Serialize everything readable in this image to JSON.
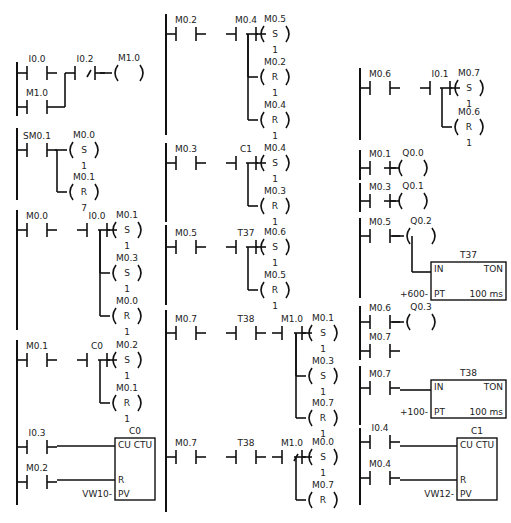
{
  "colors": {
    "line": "#111111",
    "background": "#ffffff",
    "text": "#222222"
  },
  "networks": [
    {
      "id": "n1",
      "column": 1,
      "rail_x": 17,
      "rail_y": [
        62,
        116
      ],
      "elements": [
        {
          "type": "contact",
          "label": "I0.0",
          "x": 17,
          "y": 73,
          "len": 40
        },
        {
          "type": "contact",
          "label": "M1.0",
          "x": 17,
          "y": 107,
          "len": 40,
          "branch_to_x": 65,
          "join_y": 73
        },
        {
          "type": "contact_nc",
          "label": "I0.2",
          "x": 65,
          "y": 73,
          "len": 30
        },
        {
          "type": "coil",
          "label": "M1.0",
          "op": "",
          "num": "",
          "x": 112,
          "y": 73
        }
      ]
    },
    {
      "id": "n2",
      "column": 1,
      "rail_x": 17,
      "rail_y": [
        128,
        200
      ],
      "elements": [
        {
          "type": "contact",
          "label": "SM0.1",
          "x": 17,
          "y": 150,
          "len": 40
        },
        {
          "type": "coil",
          "label": "M0.0",
          "op": "S",
          "num": "1",
          "x": 67,
          "y": 150
        },
        {
          "type": "coil",
          "label": "M0.1",
          "op": "R",
          "num": "7",
          "x": 67,
          "y": 192,
          "branch": true
        }
      ]
    },
    {
      "id": "n3",
      "column": 1,
      "rail_x": 17,
      "rail_y": [
        210,
        330
      ],
      "elements": [
        {
          "type": "contact",
          "label": "M0.0",
          "x": 17,
          "y": 230,
          "len": 40
        },
        {
          "type": "contact",
          "label": "I0.0",
          "x": 77,
          "y": 230,
          "len": 40
        },
        {
          "type": "coil",
          "label": "M0.1",
          "op": "S",
          "num": "1",
          "x": 110,
          "y": 230
        },
        {
          "type": "coil",
          "label": "M0.3",
          "op": "S",
          "num": "1",
          "x": 110,
          "y": 273,
          "branch": true
        },
        {
          "type": "coil",
          "label": "M0.0",
          "op": "R",
          "num": "1",
          "x": 110,
          "y": 316,
          "branch": true
        }
      ]
    },
    {
      "id": "n4",
      "column": 1,
      "rail_x": 17,
      "rail_y": [
        340,
        430
      ],
      "elements": [
        {
          "type": "contact",
          "label": "M0.1",
          "x": 17,
          "y": 360,
          "len": 40
        },
        {
          "type": "contact",
          "label": "C0",
          "x": 77,
          "y": 360,
          "len": 40
        },
        {
          "type": "coil",
          "label": "M0.2",
          "op": "S",
          "num": "1",
          "x": 110,
          "y": 360
        },
        {
          "type": "coil",
          "label": "M0.1",
          "op": "R",
          "num": "1",
          "x": 110,
          "y": 403,
          "branch": true
        }
      ]
    },
    {
      "id": "n5",
      "column": 1,
      "rail_x": 17,
      "rail_y": [
        430,
        505
      ],
      "elements": [
        {
          "type": "contact",
          "label": "I0.3",
          "x": 17,
          "y": 447,
          "len": 40
        },
        {
          "type": "contact",
          "label": "M0.2",
          "x": 17,
          "y": 482,
          "len": 40
        },
        {
          "type": "counter",
          "label": "C0",
          "box_type": "CTU",
          "x": 115,
          "y": 438,
          "w": 40,
          "h": 62,
          "pins": [
            "CU",
            "R",
            "PV"
          ],
          "pv": "VW10"
        }
      ]
    },
    {
      "id": "n6",
      "column": 2,
      "rail_x": 166,
      "rail_y": [
        14,
        135
      ],
      "elements": [
        {
          "type": "contact",
          "label": "M0.2",
          "x": 166,
          "y": 34,
          "len": 40
        },
        {
          "type": "contact",
          "label": "M0.4",
          "x": 226,
          "y": 34,
          "len": 40
        },
        {
          "type": "coil",
          "label": "M0.5",
          "op": "S",
          "num": "1",
          "x": 258,
          "y": 34
        },
        {
          "type": "coil",
          "label": "M0.2",
          "op": "R",
          "num": "1",
          "x": 258,
          "y": 77,
          "branch": true
        },
        {
          "type": "coil",
          "label": "M0.4",
          "op": "R",
          "num": "1",
          "x": 258,
          "y": 120,
          "branch": true
        }
      ]
    },
    {
      "id": "n7",
      "column": 2,
      "rail_x": 166,
      "rail_y": [
        143,
        222
      ],
      "elements": [
        {
          "type": "contact",
          "label": "M0.3",
          "x": 166,
          "y": 163,
          "len": 40
        },
        {
          "type": "contact",
          "label": "C1",
          "x": 226,
          "y": 163,
          "len": 40
        },
        {
          "type": "coil",
          "label": "M0.4",
          "op": "S",
          "num": "1",
          "x": 258,
          "y": 163
        },
        {
          "type": "coil",
          "label": "M0.3",
          "op": "R",
          "num": "1",
          "x": 258,
          "y": 206,
          "branch": true
        }
      ]
    },
    {
      "id": "n8",
      "column": 2,
      "rail_x": 166,
      "rail_y": [
        225,
        305
      ],
      "elements": [
        {
          "type": "contact",
          "label": "M0.5",
          "x": 166,
          "y": 247,
          "len": 40
        },
        {
          "type": "contact",
          "label": "T37",
          "x": 226,
          "y": 247,
          "len": 40
        },
        {
          "type": "coil",
          "label": "M0.6",
          "op": "S",
          "num": "1",
          "x": 258,
          "y": 247
        },
        {
          "type": "coil",
          "label": "M0.5",
          "op": "R",
          "num": "1",
          "x": 258,
          "y": 290,
          "branch": true
        }
      ]
    },
    {
      "id": "n9",
      "column": 2,
      "rail_x": 166,
      "rail_y": [
        310,
        430
      ],
      "elements": [
        {
          "type": "contact",
          "label": "M0.7",
          "x": 166,
          "y": 333,
          "len": 40
        },
        {
          "type": "contact",
          "label": "T38",
          "x": 226,
          "y": 333,
          "len": 40
        },
        {
          "type": "contact",
          "label": "M1.0",
          "x": 272,
          "y": 333,
          "len": 40
        },
        {
          "type": "coil",
          "label": "M0.1",
          "op": "S",
          "num": "1",
          "x": 306,
          "y": 333
        },
        {
          "type": "coil",
          "label": "M0.3",
          "op": "S",
          "num": "1",
          "x": 306,
          "y": 376,
          "branch": true
        },
        {
          "type": "coil",
          "label": "M0.7",
          "op": "R",
          "num": "1",
          "x": 306,
          "y": 418,
          "branch": true
        }
      ]
    },
    {
      "id": "n10",
      "column": 2,
      "rail_x": 166,
      "rail_y": [
        430,
        512
      ],
      "elements": [
        {
          "type": "contact",
          "label": "M0.7",
          "x": 166,
          "y": 457,
          "len": 40
        },
        {
          "type": "contact",
          "label": "T38",
          "x": 226,
          "y": 457,
          "len": 40
        },
        {
          "type": "contact_nc",
          "label": "M1.0",
          "x": 272,
          "y": 457,
          "len": 40
        },
        {
          "type": "coil",
          "label": "M0.0",
          "op": "S",
          "num": "1",
          "x": 306,
          "y": 457
        },
        {
          "type": "coil",
          "label": "M0.7",
          "op": "R",
          "num": "",
          "x": 306,
          "y": 500,
          "branch": true
        }
      ]
    },
    {
      "id": "n11",
      "column": 3,
      "rail_x": 360,
      "rail_y": [
        68,
        140
      ],
      "elements": [
        {
          "type": "contact",
          "label": "M0.6",
          "x": 360,
          "y": 88,
          "len": 40
        },
        {
          "type": "contact",
          "label": "I0.1",
          "x": 420,
          "y": 88,
          "len": 40
        },
        {
          "type": "coil",
          "label": "M0.7",
          "op": "S",
          "num": "1",
          "x": 452,
          "y": 88
        },
        {
          "type": "coil",
          "label": "M0.6",
          "op": "R",
          "num": "1",
          "x": 452,
          "y": 127,
          "branch": true
        }
      ]
    },
    {
      "id": "n12",
      "column": 3,
      "rail_x": 360,
      "rail_y": [
        150,
        180
      ],
      "elements": [
        {
          "type": "contact",
          "label": "M0.1",
          "x": 360,
          "y": 168,
          "len": 40
        },
        {
          "type": "coil",
          "label": "Q0.0",
          "op": "",
          "num": "",
          "x": 396,
          "y": 168
        }
      ]
    },
    {
      "id": "n13",
      "column": 3,
      "rail_x": 360,
      "rail_y": [
        183,
        212
      ],
      "elements": [
        {
          "type": "contact",
          "label": "M0.3",
          "x": 360,
          "y": 201,
          "len": 40
        },
        {
          "type": "coil",
          "label": "Q0.1",
          "op": "",
          "num": "",
          "x": 396,
          "y": 201
        }
      ]
    },
    {
      "id": "n14",
      "column": 3,
      "rail_x": 360,
      "rail_y": [
        218,
        298
      ],
      "elements": [
        {
          "type": "contact",
          "label": "M0.5",
          "x": 360,
          "y": 236,
          "len": 40
        },
        {
          "type": "coil",
          "label": "Q0.2",
          "op": "",
          "num": "",
          "x": 404,
          "y": 236
        },
        {
          "type": "timer",
          "label": "T37",
          "box_type": "TON",
          "x": 431,
          "y": 262,
          "w": 75,
          "h": 38,
          "pins": [
            "IN",
            "PT"
          ],
          "pt": "+600",
          "base": "100 ms"
        }
      ]
    },
    {
      "id": "n15",
      "column": 3,
      "rail_x": 360,
      "rail_y": [
        306,
        360
      ],
      "elements": [
        {
          "type": "contact",
          "label": "M0.6",
          "x": 360,
          "y": 322,
          "len": 40
        },
        {
          "type": "contact",
          "label": "M0.7",
          "x": 360,
          "y": 351,
          "len": 40
        },
        {
          "type": "coil",
          "label": "Q0.3",
          "op": "",
          "num": "",
          "x": 404,
          "y": 322
        }
      ]
    },
    {
      "id": "n16",
      "column": 3,
      "rail_x": 360,
      "rail_y": [
        366,
        425
      ],
      "elements": [
        {
          "type": "contact",
          "label": "M0.7",
          "x": 360,
          "y": 388,
          "len": 40
        },
        {
          "type": "timer",
          "label": "T38",
          "box_type": "TON",
          "x": 431,
          "y": 380,
          "w": 75,
          "h": 38,
          "pins": [
            "IN",
            "PT"
          ],
          "pt": "+100",
          "base": "100 ms"
        }
      ]
    },
    {
      "id": "n17",
      "column": 3,
      "rail_x": 360,
      "rail_y": [
        428,
        505
      ],
      "elements": [
        {
          "type": "contact",
          "label": "I0.4",
          "x": 360,
          "y": 442,
          "len": 40
        },
        {
          "type": "contact",
          "label": "M0.4",
          "x": 360,
          "y": 478,
          "len": 40
        },
        {
          "type": "counter",
          "label": "C1",
          "box_type": "CTU",
          "x": 457,
          "y": 438,
          "w": 40,
          "h": 62,
          "pins": [
            "CU",
            "R",
            "PV"
          ],
          "pv": "VW12"
        }
      ]
    }
  ]
}
